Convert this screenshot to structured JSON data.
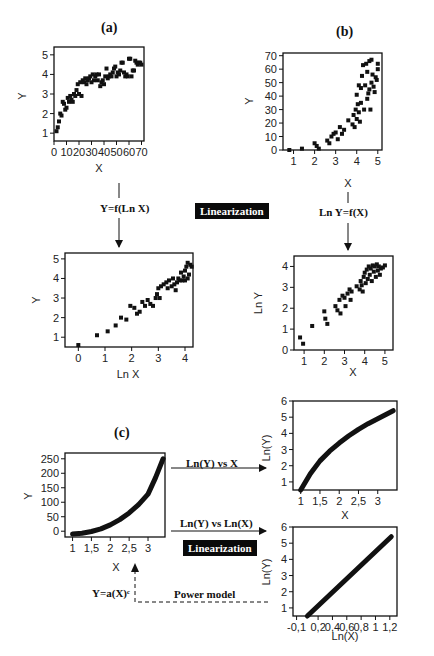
{
  "labels": {
    "panel_a": "(a)",
    "panel_b": "(b)",
    "panel_c": "(c)",
    "transform_a": "Y=f(Ln X)",
    "transform_b": "Ln Y=f(X)",
    "linearization_top": "Linearization",
    "linearization_bottom": "Linearization",
    "arrow_c1": "Ln(Y) vs X",
    "arrow_c2": "Ln(Y) vs Ln(X)",
    "power_eq": "Y=a(X)ᶜ",
    "power_model": "Power model"
  },
  "chart_data": [
    {
      "id": "a_top",
      "type": "scatter",
      "title": "(a)",
      "xlabel": "X",
      "ylabel": "Y",
      "xlim": [
        0,
        72
      ],
      "ylim": [
        0.6,
        5.4
      ],
      "xticks": [
        0,
        10,
        20,
        30,
        40,
        50,
        60,
        70
      ],
      "yticks": [
        1,
        2,
        3,
        4,
        5
      ],
      "points": [
        [
          2,
          1.1
        ],
        [
          3,
          1.3
        ],
        [
          4,
          1.6
        ],
        [
          5,
          2.0
        ],
        [
          6,
          1.9
        ],
        [
          7,
          2.6
        ],
        [
          8,
          2.5
        ],
        [
          9,
          2.2
        ],
        [
          10,
          2.3
        ],
        [
          11,
          2.8
        ],
        [
          12,
          2.6
        ],
        [
          13,
          2.9
        ],
        [
          14,
          2.7
        ],
        [
          15,
          2.6
        ],
        [
          16,
          3.0
        ],
        [
          17,
          2.9
        ],
        [
          18,
          3.2
        ],
        [
          19,
          3.5
        ],
        [
          20,
          3.0
        ],
        [
          21,
          3.6
        ],
        [
          22,
          2.9
        ],
        [
          23,
          3.7
        ],
        [
          24,
          3.6
        ],
        [
          25,
          3.8
        ],
        [
          26,
          3.5
        ],
        [
          27,
          3.7
        ],
        [
          28,
          3.8
        ],
        [
          29,
          3.9
        ],
        [
          30,
          3.6
        ],
        [
          31,
          4.0
        ],
        [
          32,
          3.7
        ],
        [
          33,
          3.9
        ],
        [
          34,
          4.0
        ],
        [
          35,
          3.7
        ],
        [
          36,
          4.0
        ],
        [
          37,
          3.4
        ],
        [
          38,
          3.6
        ],
        [
          39,
          3.7
        ],
        [
          40,
          3.5
        ],
        [
          41,
          3.9
        ],
        [
          42,
          4.3
        ],
        [
          43,
          3.8
        ],
        [
          44,
          3.9
        ],
        [
          45,
          4.0
        ],
        [
          46,
          3.9
        ],
        [
          47,
          4.1
        ],
        [
          48,
          4.3
        ],
        [
          49,
          4.4
        ],
        [
          50,
          3.9
        ],
        [
          51,
          4.1
        ],
        [
          52,
          4.0
        ],
        [
          53,
          4.2
        ],
        [
          54,
          4.6
        ],
        [
          55,
          4.6
        ],
        [
          56,
          4.1
        ],
        [
          57,
          3.9
        ],
        [
          58,
          4.0
        ],
        [
          59,
          3.9
        ],
        [
          60,
          4.8
        ],
        [
          61,
          4.8
        ],
        [
          62,
          3.9
        ],
        [
          63,
          4.2
        ],
        [
          64,
          4.2
        ],
        [
          65,
          4.7
        ],
        [
          66,
          4.6
        ],
        [
          67,
          4.5
        ],
        [
          68,
          4.6
        ],
        [
          69,
          4.6
        ],
        [
          70,
          4.5
        ]
      ]
    },
    {
      "id": "b_top",
      "type": "scatter",
      "title": "(b)",
      "xlabel": "X",
      "ylabel": "Y",
      "xlim": [
        0.5,
        5.2
      ],
      "ylim": [
        0,
        72
      ],
      "xticks": [
        1,
        2,
        3,
        4,
        5
      ],
      "yticks": [
        0,
        10,
        20,
        30,
        40,
        50,
        60,
        70
      ],
      "points": [
        [
          0.8,
          0
        ],
        [
          1.4,
          1
        ],
        [
          2.0,
          5
        ],
        [
          2.1,
          3
        ],
        [
          2.2,
          1
        ],
        [
          2.6,
          7
        ],
        [
          2.7,
          5
        ],
        [
          2.8,
          10
        ],
        [
          2.9,
          12
        ],
        [
          3.0,
          13
        ],
        [
          3.1,
          8
        ],
        [
          3.2,
          17
        ],
        [
          3.3,
          12
        ],
        [
          3.4,
          15
        ],
        [
          3.6,
          22
        ],
        [
          3.8,
          19
        ],
        [
          3.85,
          26
        ],
        [
          3.9,
          17
        ],
        [
          3.95,
          30
        ],
        [
          4.0,
          41
        ],
        [
          4.0,
          23
        ],
        [
          4.05,
          34
        ],
        [
          4.1,
          28
        ],
        [
          4.1,
          48
        ],
        [
          4.15,
          21
        ],
        [
          4.2,
          46
        ],
        [
          4.2,
          35
        ],
        [
          4.25,
          55
        ],
        [
          4.3,
          63
        ],
        [
          4.35,
          30
        ],
        [
          4.4,
          48
        ],
        [
          4.45,
          64
        ],
        [
          4.5,
          58
        ],
        [
          4.5,
          38
        ],
        [
          4.55,
          42
        ],
        [
          4.6,
          66
        ],
        [
          4.6,
          45
        ],
        [
          4.65,
          30
        ],
        [
          4.7,
          50
        ],
        [
          4.7,
          67
        ],
        [
          4.75,
          56
        ],
        [
          4.8,
          47
        ],
        [
          4.85,
          43
        ],
        [
          4.9,
          54
        ],
        [
          4.95,
          52
        ],
        [
          5.0,
          60
        ],
        [
          5.0,
          64
        ]
      ]
    },
    {
      "id": "a_bottom",
      "type": "scatter",
      "xlabel": "Ln X",
      "ylabel": "Y",
      "xlim": [
        -0.5,
        4.3
      ],
      "ylim": [
        0.5,
        5.3
      ],
      "xticks": [
        0,
        1,
        2,
        3,
        4
      ],
      "yticks": [
        1,
        2,
        3,
        4,
        5
      ],
      "points": [
        [
          0,
          0.6
        ],
        [
          0.7,
          1.1
        ],
        [
          1.1,
          1.3
        ],
        [
          1.4,
          1.6
        ],
        [
          1.6,
          2.0
        ],
        [
          1.8,
          1.9
        ],
        [
          1.95,
          2.6
        ],
        [
          2.1,
          2.5
        ],
        [
          2.2,
          2.2
        ],
        [
          2.3,
          2.3
        ],
        [
          2.4,
          2.8
        ],
        [
          2.5,
          2.6
        ],
        [
          2.6,
          2.9
        ],
        [
          2.7,
          2.7
        ],
        [
          2.8,
          2.6
        ],
        [
          2.9,
          3.0
        ],
        [
          2.95,
          3.2
        ],
        [
          3.0,
          3.5
        ],
        [
          3.05,
          3.0
        ],
        [
          3.1,
          3.6
        ],
        [
          3.2,
          3.7
        ],
        [
          3.3,
          3.8
        ],
        [
          3.35,
          3.5
        ],
        [
          3.4,
          3.9
        ],
        [
          3.5,
          3.6
        ],
        [
          3.55,
          4.0
        ],
        [
          3.6,
          3.7
        ],
        [
          3.65,
          3.4
        ],
        [
          3.7,
          3.8
        ],
        [
          3.75,
          4.0
        ],
        [
          3.8,
          3.9
        ],
        [
          3.85,
          4.3
        ],
        [
          3.9,
          3.9
        ],
        [
          3.95,
          4.1
        ],
        [
          4.0,
          4.4
        ],
        [
          4.0,
          3.9
        ],
        [
          4.05,
          4.6
        ],
        [
          4.1,
          4.8
        ],
        [
          4.1,
          4.0
        ],
        [
          4.15,
          4.2
        ],
        [
          4.2,
          4.7
        ],
        [
          4.25,
          4.6
        ]
      ]
    },
    {
      "id": "b_bottom",
      "type": "scatter",
      "xlabel": "X",
      "ylabel": "Ln Y",
      "xlim": [
        0.5,
        5.4
      ],
      "ylim": [
        0,
        4.5
      ],
      "xticks": [
        1,
        2,
        3,
        4,
        5
      ],
      "yticks": [
        0,
        1,
        2,
        3,
        4
      ],
      "points": [
        [
          0.8,
          0.6
        ],
        [
          0.95,
          0.3
        ],
        [
          1.4,
          1.15
        ],
        [
          2.0,
          1.85
        ],
        [
          2.05,
          1.5
        ],
        [
          2.15,
          1.25
        ],
        [
          2.55,
          2.1
        ],
        [
          2.65,
          1.9
        ],
        [
          2.75,
          2.4
        ],
        [
          2.8,
          1.75
        ],
        [
          2.9,
          2.6
        ],
        [
          3.0,
          2.5
        ],
        [
          3.05,
          2.1
        ],
        [
          3.15,
          2.7
        ],
        [
          3.25,
          2.9
        ],
        [
          3.3,
          2.4
        ],
        [
          3.35,
          2.8
        ],
        [
          3.6,
          3.05
        ],
        [
          3.75,
          2.9
        ],
        [
          3.8,
          3.3
        ],
        [
          3.85,
          3.1
        ],
        [
          3.9,
          2.8
        ],
        [
          3.95,
          3.5
        ],
        [
          4.0,
          3.7
        ],
        [
          4.05,
          3.2
        ],
        [
          4.1,
          3.85
        ],
        [
          4.15,
          3.4
        ],
        [
          4.2,
          4.0
        ],
        [
          4.25,
          3.6
        ],
        [
          4.3,
          3.9
        ],
        [
          4.35,
          3.3
        ],
        [
          4.4,
          4.05
        ],
        [
          4.45,
          3.75
        ],
        [
          4.5,
          4.0
        ],
        [
          4.55,
          3.5
        ],
        [
          4.6,
          4.1
        ],
        [
          4.65,
          3.8
        ],
        [
          4.7,
          4.0
        ],
        [
          4.75,
          3.6
        ],
        [
          4.8,
          3.9
        ],
        [
          4.9,
          3.95
        ],
        [
          5.0,
          4.05
        ]
      ]
    },
    {
      "id": "c_left",
      "type": "line",
      "title": "(c)",
      "xlabel": "X",
      "ylabel": "Y",
      "xlim": [
        0.8,
        3.45
      ],
      "ylim": [
        -20,
        270
      ],
      "xticks": [
        1,
        1.5,
        2,
        2.5,
        3
      ],
      "xtick_labels": [
        "1",
        "1,5",
        "2",
        "2,5",
        "3"
      ],
      "yticks": [
        0,
        50,
        100,
        150,
        200,
        250
      ],
      "model": "Y=a(X)^c",
      "x": [
        1.0,
        1.25,
        1.5,
        1.75,
        2.0,
        2.25,
        2.5,
        2.75,
        3.0,
        3.2,
        3.4
      ],
      "values": [
        -10,
        -7,
        -1,
        8,
        22,
        40,
        63,
        92,
        128,
        185,
        250
      ]
    },
    {
      "id": "c_top_right",
      "type": "line",
      "xlabel": "X",
      "ylabel": "Ln(Y)",
      "xlim": [
        0.8,
        3.5
      ],
      "ylim": [
        0.5,
        6
      ],
      "xticks": [
        1,
        1.5,
        2,
        2.5,
        3
      ],
      "xtick_labels": [
        "1",
        "1,5",
        "2",
        "2,5",
        "3"
      ],
      "yticks": [
        1,
        2,
        3,
        4,
        5,
        6
      ],
      "x": [
        1.0,
        1.25,
        1.5,
        1.75,
        2.0,
        2.25,
        2.5,
        2.75,
        3.0,
        3.2,
        3.4
      ],
      "values": [
        0.5,
        1.5,
        2.3,
        2.9,
        3.4,
        3.85,
        4.25,
        4.6,
        4.9,
        5.15,
        5.4
      ]
    },
    {
      "id": "c_bottom_right",
      "type": "line",
      "xlabel": "Ln(X)",
      "ylabel": "Ln(Y)",
      "xlim": [
        -0.15,
        1.3
      ],
      "ylim": [
        0.5,
        6
      ],
      "xticks": [
        -0.1,
        0.2,
        0.4,
        0.6,
        0.8,
        1,
        1.2
      ],
      "xtick_labels": [
        "-0,1",
        "0,2",
        "0,4",
        "0,6",
        "0,8",
        "1",
        "1,2"
      ],
      "yticks": [
        1,
        2,
        3,
        4,
        5,
        6
      ],
      "x": [
        0.05,
        1.22
      ],
      "values": [
        0.5,
        5.4
      ]
    }
  ]
}
